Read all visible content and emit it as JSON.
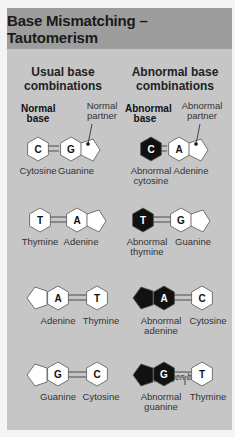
{
  "title": "Base Mismatching – Tautomerism",
  "columns": {
    "usual": "Usual base combinations",
    "abnormal": "Abnormal base combinations"
  },
  "annotations": {
    "normal_base": "Normal base",
    "normal_partner": "Normal partner",
    "abnormal_base": "Abnormal base",
    "abnormal_partner": "Abnormal partner",
    "hydrogen_bonds": "Hydrogen bonds"
  },
  "rows": [
    {
      "usual": {
        "left": {
          "letter": "C",
          "label": "Cytosine"
        },
        "right": {
          "letter": "G",
          "label": "Guanine"
        }
      },
      "abnormal": {
        "left": {
          "letter": "C",
          "label": "Abnormal cytosine"
        },
        "right": {
          "letter": "A",
          "label": "Adenine"
        }
      }
    },
    {
      "usual": {
        "left": {
          "letter": "T",
          "label": "Thymine"
        },
        "right": {
          "letter": "A",
          "label": "Adenine"
        }
      },
      "abnormal": {
        "left": {
          "letter": "T",
          "label": "Abnormal thymine"
        },
        "right": {
          "letter": "G",
          "label": "Guanine"
        }
      }
    },
    {
      "usual": {
        "left": {
          "letter": "A",
          "label": "Adenine"
        },
        "right": {
          "letter": "T",
          "label": "Thymine"
        }
      },
      "abnormal": {
        "left": {
          "letter": "A",
          "label": "Abnormal adenine"
        },
        "right": {
          "letter": "C",
          "label": "Cytosine"
        }
      }
    },
    {
      "usual": {
        "left": {
          "letter": "G",
          "label": "Guanine"
        },
        "right": {
          "letter": "C",
          "label": "Cytosine"
        }
      },
      "abnormal": {
        "left": {
          "letter": "G",
          "label": "Abnormal guanine"
        },
        "right": {
          "letter": "T",
          "label": "Thymine"
        }
      }
    }
  ],
  "colors": {
    "header_bg": "#9d9d9d",
    "body_bg": "#c6c6c6",
    "normal_base": "#ffffff",
    "abnormal_base": "#111111",
    "bond": "#8a8a8a"
  }
}
